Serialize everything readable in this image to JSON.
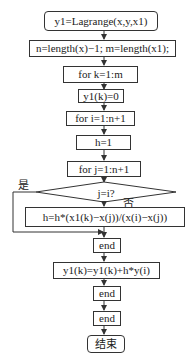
{
  "flowchart": {
    "nodes": {
      "start": "y1=Lagrange(x,y,x1)",
      "init_lengths": "n=length(x)−1; m=length(x1);",
      "loop_k": "for k=1:m",
      "init_y1k": "y1(k)=0",
      "loop_i": "for i=1:n+1",
      "init_h": "h=1",
      "loop_j": "for j=1:n+1",
      "decision": "j=i?",
      "update_h": "h=h*(x1(k)−x(j))/(x(i)−x(j))",
      "end_j": "end",
      "accumulate": "y1(k)=y1(k)+h*y(i)",
      "end_i": "end",
      "end_k": "end",
      "finish": "结束"
    },
    "edge_labels": {
      "yes": "是",
      "no": "否"
    },
    "colors": {
      "stroke": "#333333",
      "background": "#ffffff"
    }
  }
}
